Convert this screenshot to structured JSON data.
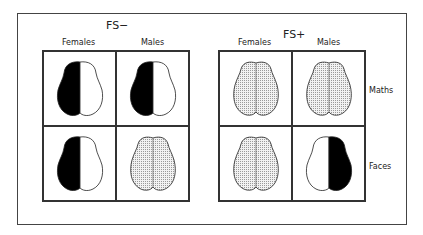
{
  "groups": [
    {
      "title": "FS−",
      "columns": [
        "Females",
        "Males"
      ],
      "cells": [
        {
          "row": "Maths",
          "column": "Females",
          "brain": "left-dark"
        },
        {
          "row": "Maths",
          "column": "Males",
          "brain": "left-dark"
        },
        {
          "row": "Faces",
          "column": "Females",
          "brain": "left-dark"
        },
        {
          "row": "Faces",
          "column": "Males",
          "brain": "bilateral-stippled"
        }
      ]
    },
    {
      "title": "FS+",
      "columns": [
        "Females",
        "Males"
      ],
      "cells": [
        {
          "row": "Maths",
          "column": "Females",
          "brain": "bilateral-stippled"
        },
        {
          "row": "Maths",
          "column": "Males",
          "brain": "bilateral-stippled"
        },
        {
          "row": "Faces",
          "column": "Females",
          "brain": "bilateral-stippled"
        },
        {
          "row": "Faces",
          "column": "Males",
          "brain": "right-dark"
        }
      ]
    }
  ],
  "rows": [
    "Maths",
    "Faces"
  ],
  "colors": {
    "dark": "#000000",
    "stipple": "#d9d9d9",
    "outline": "#222222"
  }
}
